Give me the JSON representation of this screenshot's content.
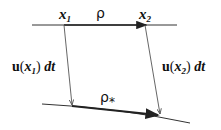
{
  "diagram": {
    "top_line": {
      "start_label": "x",
      "start_sub": "1",
      "end_label": "x",
      "end_sub": "2",
      "mid_label": "ρ"
    },
    "bottom_curve": {
      "label": "ρ",
      "label_sub": "*"
    },
    "left_arrow": {
      "label_vec": "u",
      "label_open": "(",
      "label_var": "x",
      "label_sub": "1",
      "label_close": ")",
      "label_dt": "dt"
    },
    "right_arrow": {
      "label_vec": "u",
      "label_open": "(",
      "label_var": "x",
      "label_sub": "2",
      "label_close": ")",
      "label_dt": "dt"
    },
    "colors": {
      "line": "#222222",
      "thin_line": "#555555"
    }
  }
}
